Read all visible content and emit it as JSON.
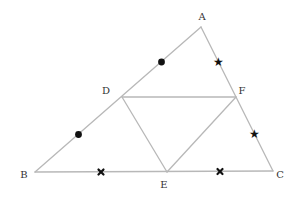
{
  "diagram": {
    "colors": {
      "edge": "#b8b8b8",
      "marker": "#111111",
      "label": "#333333"
    },
    "vertices": [
      {
        "id": "A",
        "label": "A"
      },
      {
        "id": "B",
        "label": "B"
      },
      {
        "id": "C",
        "label": "C"
      },
      {
        "id": "D",
        "label": "D"
      },
      {
        "id": "E",
        "label": "E"
      },
      {
        "id": "F",
        "label": "F"
      }
    ],
    "segments": [
      {
        "from": "A",
        "to": "B"
      },
      {
        "from": "B",
        "to": "C"
      },
      {
        "from": "C",
        "to": "A"
      },
      {
        "from": "D",
        "to": "F"
      },
      {
        "from": "D",
        "to": "E"
      },
      {
        "from": "E",
        "to": "F"
      }
    ],
    "equal_length_marks": [
      {
        "segment": "AD",
        "symbol": "dot"
      },
      {
        "segment": "DB",
        "symbol": "dot"
      },
      {
        "segment": "AF",
        "symbol": "star"
      },
      {
        "segment": "FC",
        "symbol": "star"
      },
      {
        "segment": "BE",
        "symbol": "cross"
      },
      {
        "segment": "EC",
        "symbol": "cross"
      }
    ],
    "star_glyph": "★"
  }
}
